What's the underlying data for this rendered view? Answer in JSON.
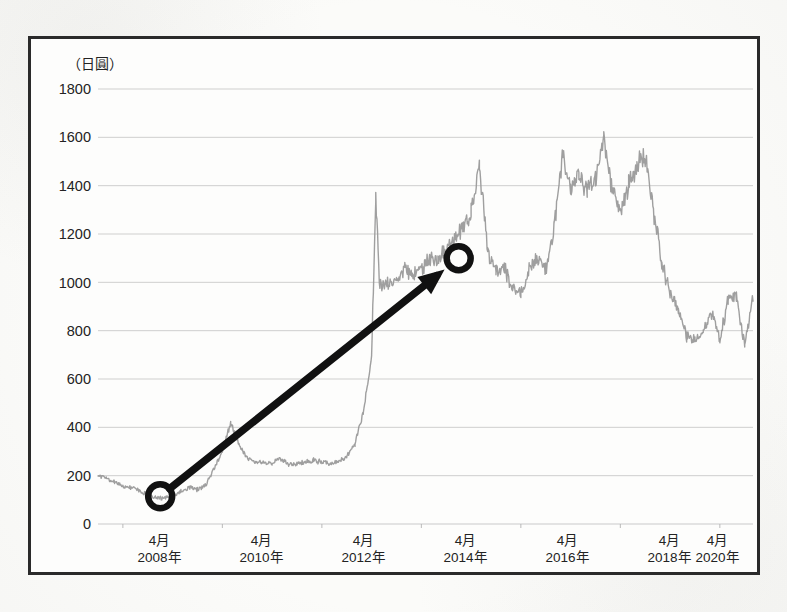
{
  "figure": {
    "unit_label": "（日圓）",
    "background_color": "#fbfbf9",
    "frame_color": "#2a2a2a",
    "series_color": "#9a9a9a",
    "annotation_color": "#111111",
    "gridline_color": "#c9c9c9"
  },
  "annotations": {
    "start_marker_label": "start-circle",
    "end_marker_label": "end-circle",
    "arrow_label": "trend-arrow",
    "start_point": {
      "x_date": "2009-01",
      "y_value": 115
    },
    "end_point": {
      "x_date": "2015-01",
      "y_value": 1100
    }
  },
  "chart_data": {
    "type": "line",
    "title": "",
    "subtitle": "",
    "xlabel": "",
    "ylabel": "（日圓）",
    "ylim": [
      0,
      1800
    ],
    "ytick_values": [
      1800,
      1600,
      1400,
      1200,
      1000,
      800,
      600,
      400,
      200,
      0
    ],
    "ytick_labels": [
      "1800",
      "1600",
      "1400",
      "1200",
      "1000",
      "800",
      "600",
      "400",
      "200",
      "0"
    ],
    "xtick_labels": [
      {
        "month": "4月",
        "year": "2008年"
      },
      {
        "month": "4月",
        "year": "2010年"
      },
      {
        "month": "4月",
        "year": "2012年"
      },
      {
        "month": "4月",
        "year": "2014年"
      },
      {
        "month": "4月",
        "year": "2016年"
      },
      {
        "month": "4月",
        "year": "2018年"
      },
      {
        "month": "4月",
        "year": "2020年"
      }
    ],
    "xlim": [
      "2007-10",
      "2020-12"
    ],
    "grid": true,
    "legend": false,
    "series": [
      {
        "name": "株価",
        "color": "#9a9a9a",
        "x": [
          "2007-10",
          "2007-12",
          "2008-02",
          "2008-04",
          "2008-06",
          "2008-08",
          "2008-10",
          "2008-12",
          "2009-02",
          "2009-04",
          "2009-06",
          "2009-08",
          "2009-10",
          "2009-12",
          "2010-02",
          "2010-04",
          "2010-06",
          "2010-08",
          "2010-10",
          "2010-12",
          "2011-02",
          "2011-04",
          "2011-06",
          "2011-08",
          "2011-10",
          "2011-12",
          "2012-02",
          "2012-04",
          "2012-06",
          "2012-08",
          "2012-10",
          "2012-12",
          "2013-02",
          "2013-04",
          "2013-05",
          "2013-06",
          "2013-08",
          "2013-10",
          "2013-12",
          "2014-02",
          "2014-04",
          "2014-06",
          "2014-08",
          "2014-10",
          "2014-12",
          "2015-02",
          "2015-04",
          "2015-06",
          "2015-08",
          "2015-10",
          "2015-12",
          "2016-02",
          "2016-04",
          "2016-06",
          "2016-08",
          "2016-10",
          "2016-12",
          "2017-02",
          "2017-04",
          "2017-06",
          "2017-08",
          "2017-10",
          "2017-12",
          "2018-02",
          "2018-04",
          "2018-06",
          "2018-08",
          "2018-10",
          "2018-12",
          "2019-02",
          "2019-04",
          "2019-06",
          "2019-08",
          "2019-10",
          "2019-12",
          "2020-02",
          "2020-04",
          "2020-06",
          "2020-08",
          "2020-10",
          "2020-12"
        ],
        "values": [
          205,
          190,
          175,
          160,
          150,
          140,
          120,
          105,
          110,
          115,
          135,
          150,
          145,
          160,
          230,
          300,
          420,
          330,
          270,
          260,
          255,
          250,
          270,
          245,
          250,
          255,
          265,
          255,
          250,
          260,
          280,
          330,
          460,
          700,
          1340,
          980,
          1000,
          1010,
          1060,
          1020,
          1060,
          1090,
          1100,
          1130,
          1180,
          1230,
          1290,
          1480,
          1130,
          1050,
          1060,
          980,
          950,
          1060,
          1100,
          1050,
          1230,
          1530,
          1400,
          1440,
          1380,
          1420,
          1610,
          1380,
          1300,
          1400,
          1480,
          1520,
          1300,
          1080,
          960,
          880,
          780,
          760,
          800,
          880,
          760,
          930,
          950,
          730,
          950
        ]
      }
    ]
  }
}
